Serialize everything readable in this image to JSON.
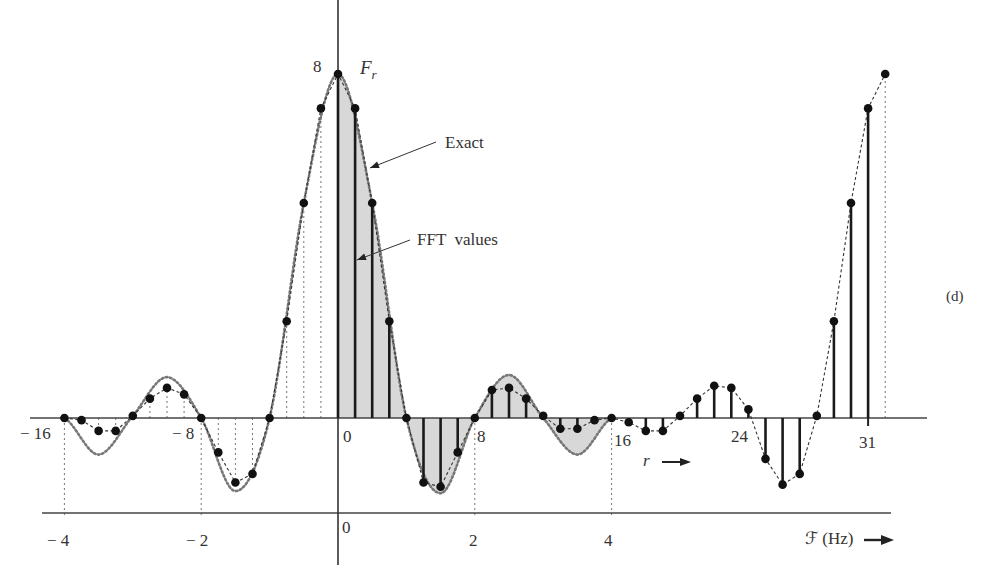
{
  "figure": {
    "panel_label": "(d)",
    "annotations": [
      {
        "id": "exact",
        "text": "Exact"
      },
      {
        "id": "fft",
        "text": "FFT  values"
      }
    ],
    "y_axis_label": "F",
    "y_axis_label_sub": "r",
    "y_peak_tick": "8",
    "r_axis_label": "r",
    "hz_axis_label": "ℱ (Hz)",
    "r_ticks": [
      "− 16",
      "− 8",
      "0",
      "8",
      "16",
      "24",
      "31"
    ],
    "hz_ticks": [
      "− 4",
      "− 2",
      "0",
      "2",
      "4"
    ]
  },
  "chart_data": {
    "type": "line",
    "title": "",
    "subtitle": "(d)",
    "xlabel": "r (sample index) / ℱ (Hz)",
    "ylabel": "F_r",
    "grid": false,
    "legend": "annotations with arrows: 'Exact' (dotted continuous spectrum), 'FFT values' (stems with dots)",
    "r_axis": {
      "range": [
        -16,
        32
      ],
      "ticks": [
        -16,
        -8,
        0,
        8,
        16,
        24,
        31
      ]
    },
    "hz_axis": {
      "range": [
        -4,
        4
      ],
      "ticks": [
        -4,
        -2,
        0,
        2,
        4
      ]
    },
    "ylim": [
      -2,
      8
    ],
    "y_ticks": [
      8
    ],
    "series": [
      {
        "name": "FFT values",
        "style": "stems with dots (solid stems for r = 0..31), dashed interpolation",
        "x": [
          -16,
          -15,
          -14,
          -13,
          -12,
          -11,
          -10,
          -9,
          -8,
          -7,
          -6,
          -5,
          -4,
          -3,
          -2,
          -1,
          0,
          1,
          2,
          3,
          4,
          5,
          6,
          7,
          8,
          9,
          10,
          11,
          12,
          13,
          14,
          15,
          16,
          17,
          18,
          19,
          20,
          21,
          22,
          23,
          24,
          25,
          26,
          27,
          28,
          29,
          30,
          31,
          32
        ],
        "values": [
          0,
          -0.05,
          -0.3,
          -0.3,
          0.05,
          0.45,
          0.7,
          0.55,
          0,
          -0.8,
          -1.5,
          -1.3,
          0,
          2.25,
          5.0,
          7.2,
          8.0,
          7.2,
          5.0,
          2.25,
          0,
          -1.5,
          -1.6,
          -0.8,
          0,
          0.65,
          0.7,
          0.45,
          0.05,
          -0.25,
          -0.25,
          -0.05,
          0,
          -0.1,
          -0.3,
          -0.3,
          0.05,
          0.45,
          0.75,
          0.7,
          0.2,
          -0.95,
          -1.55,
          -1.3,
          0.05,
          2.25,
          5.0,
          7.2,
          8.0
        ]
      },
      {
        "name": "Exact",
        "style": "dotted continuous curve, shaded for 0 ≤ ℱ ≤ 4 Hz",
        "hz": [
          -4,
          -3.5,
          -3,
          -2.5,
          -2,
          -1.5,
          -1,
          -0.5,
          0,
          0.5,
          1,
          1.5,
          2,
          2.5,
          3,
          3.5,
          4
        ],
        "values": [
          0,
          -0.85,
          0.05,
          0.95,
          0,
          -1.7,
          0,
          5.0,
          8.0,
          5.0,
          0,
          -1.75,
          0,
          1.0,
          0,
          -0.85,
          0
        ]
      }
    ]
  }
}
